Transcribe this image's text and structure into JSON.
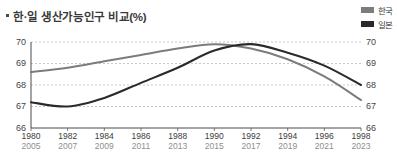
{
  "title": {
    "bullet": "▪",
    "text": "한·일 생산가능인구 비교(%)"
  },
  "legend": {
    "position": "top-right",
    "items": [
      {
        "label": "한국",
        "color": "#7c7c7c"
      },
      {
        "label": "일본",
        "color": "#2a2a2a"
      }
    ]
  },
  "chart_data": {
    "type": "line",
    "title": "한·일 생산가능인구 비교(%)",
    "xlabel": "",
    "ylabel": "",
    "ylim": [
      66,
      70
    ],
    "yticks": [
      70,
      69,
      68,
      67,
      66
    ],
    "yticks_right": [
      70,
      69,
      68,
      67,
      66
    ],
    "grid": true,
    "legend_position": "top-right",
    "x_axis_primary_name": "한국",
    "x_axis_secondary_name": "일본",
    "categories": [
      {
        "kr": "1980",
        "jp": "2005"
      },
      {
        "kr": "1982",
        "jp": "2007"
      },
      {
        "kr": "1984",
        "jp": "2009"
      },
      {
        "kr": "1986",
        "jp": "2011"
      },
      {
        "kr": "1988",
        "jp": "2013"
      },
      {
        "kr": "1990",
        "jp": "2015"
      },
      {
        "kr": "1992",
        "jp": "2017"
      },
      {
        "kr": "1994",
        "jp": "2019"
      },
      {
        "kr": "1996",
        "jp": "2021"
      },
      {
        "kr": "1998",
        "jp": "2023"
      }
    ],
    "series": [
      {
        "name": "한국",
        "color": "#7c7c7c",
        "values": [
          68.6,
          68.8,
          69.1,
          69.4,
          69.7,
          69.9,
          69.7,
          69.2,
          68.4,
          67.3
        ]
      },
      {
        "name": "일본",
        "color": "#2a2a2a",
        "values": [
          67.2,
          67.0,
          67.4,
          68.1,
          68.8,
          69.6,
          69.9,
          69.5,
          68.9,
          68.0
        ]
      }
    ]
  }
}
